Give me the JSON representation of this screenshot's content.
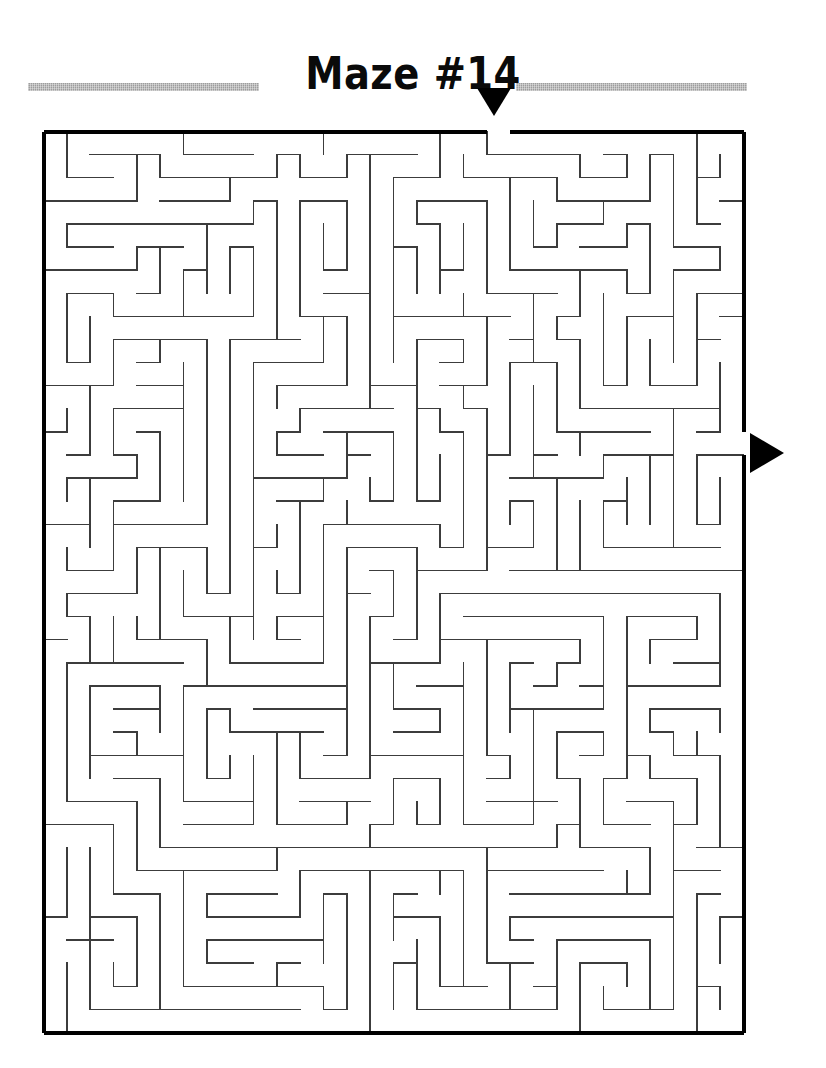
{
  "page": {
    "width": 826,
    "height": 1068,
    "background_color": "#ffffff"
  },
  "header": {
    "title": "Maze #14",
    "title_color": "#0a0a0a",
    "rule_color": "#9d9d9d",
    "rule_left": {
      "x": 28,
      "y": 55,
      "width": 231,
      "height": 8
    },
    "rule_right": {
      "x": 516,
      "y": 55,
      "width": 231,
      "height": 8
    }
  },
  "markers": {
    "entrance": {
      "icon": "triangle-down-icon",
      "label": "maze entrance",
      "color": "#000000",
      "x": 477,
      "y": 88,
      "width": 34,
      "height": 28
    },
    "exit": {
      "icon": "triangle-right-icon",
      "label": "maze exit",
      "color": "#000000",
      "x": 750,
      "y": 433,
      "width": 34,
      "height": 40
    }
  },
  "maze": {
    "title_ref": "Maze #14",
    "origin_x": 43,
    "origin_y": 131,
    "width": 700,
    "height": 901,
    "cols": 30,
    "rows": 39,
    "cell_w": 23.333,
    "cell_h": 23.103,
    "border_color": "#000000",
    "border_width": 4,
    "wall_color": "#3c3c3c",
    "wall_width": 1.4,
    "entrance": {
      "side": "top",
      "index": 19
    },
    "exit": {
      "side": "right",
      "index": 13
    },
    "seed": 140714
  }
}
